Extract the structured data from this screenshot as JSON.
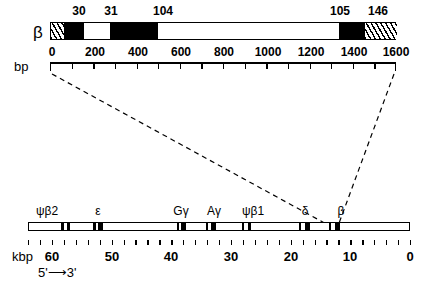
{
  "figure": {
    "type": "gene-map-diagram",
    "background": "#ffffff",
    "foreground": "#000000"
  },
  "top_panel": {
    "gene_symbol": "β",
    "codon_labels": [
      {
        "text": "30",
        "bp": 150
      },
      {
        "text": "31",
        "bp": 205
      },
      {
        "text": "104",
        "bp": 420
      },
      {
        "text": "105",
        "bp": 1355
      },
      {
        "text": "146",
        "bp": 1450
      }
    ],
    "segments": [
      {
        "name": "5-prime-utr",
        "style": "hatch",
        "start_bp": 0,
        "end_bp": 62
      },
      {
        "name": "exon-1",
        "style": "black",
        "start_bp": 62,
        "end_bp": 152
      },
      {
        "name": "intron-1",
        "style": "white",
        "start_bp": 152,
        "end_bp": 272
      },
      {
        "name": "exon-2",
        "style": "black",
        "start_bp": 272,
        "end_bp": 495
      },
      {
        "name": "intron-2",
        "style": "white",
        "start_bp": 495,
        "end_bp": 1332
      },
      {
        "name": "exon-3",
        "style": "black",
        "start_bp": 1332,
        "end_bp": 1452
      },
      {
        "name": "3-prime-utr",
        "style": "hatch",
        "start_bp": 1452,
        "end_bp": 1600
      }
    ],
    "axis": {
      "unit_label": "bp",
      "min": 0,
      "max": 1600,
      "tick_step": 100,
      "label_step": 200,
      "tick_labels": [
        "0",
        "200",
        "400",
        "600",
        "800",
        "1000",
        "1200",
        "1400",
        "1600"
      ]
    }
  },
  "bottom_panel": {
    "genes": [
      {
        "label": "ψβ2",
        "kbp": 57.5,
        "width_kbp": 1.6,
        "label_kbp": 58.5
      },
      {
        "label": "ε",
        "kbp": 53.0,
        "width_kbp": 1.6,
        "label_kbp": 53.5
      },
      {
        "label": "Gγ",
        "kbp": 38.8,
        "width_kbp": 1.6,
        "label_kbp": 39.6
      },
      {
        "label": "Aγ",
        "kbp": 34.3,
        "width_kbp": 1.6,
        "label_kbp": 35.0
      },
      {
        "label": "ψβ1",
        "kbp": 28.5,
        "width_kbp": 1.6,
        "label_kbp": 30.2
      },
      {
        "label": "δ",
        "kbp": 18.9,
        "width_kbp": 1.6,
        "label_kbp": 19.8
      },
      {
        "label": "β",
        "kbp": 12.0,
        "width_kbp": 1.6,
        "label_kbp": 12.6
      }
    ],
    "axis": {
      "unit_label": "kbp",
      "left_value": 64,
      "right_value": 0,
      "tick_step": 2,
      "tick_labels": [
        "60",
        "50",
        "40",
        "30",
        "20",
        "10",
        "0"
      ],
      "tick_label_values": [
        60,
        50,
        40,
        30,
        20,
        10,
        0
      ]
    },
    "direction_label": "5'⟶3'"
  }
}
